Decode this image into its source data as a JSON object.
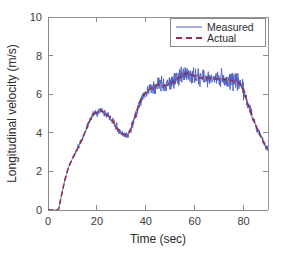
{
  "chart_data": {
    "type": "line",
    "title": "",
    "xlabel": "Time (sec)",
    "ylabel": "Longitudinal velocity (m/s)",
    "xlim": [
      0,
      90
    ],
    "ylim": [
      0,
      10
    ],
    "xticks": [
      0,
      20,
      40,
      60,
      80
    ],
    "yticks": [
      0,
      2,
      4,
      6,
      8,
      10
    ],
    "xticklabels": [
      "0",
      "20",
      "40",
      "60",
      "80"
    ],
    "yticklabels": [
      "0",
      "2",
      "4",
      "6",
      "8",
      "10"
    ],
    "grid": false,
    "legend_position": "upper right",
    "colors": {
      "measured": "#4f5fbf",
      "actual": "#93304a",
      "axis": "#8a8a8a",
      "text": "#2b2b2b",
      "background": "#ffffff"
    },
    "series": [
      {
        "name": "Measured",
        "style": "solid",
        "color": "#4f5fbf",
        "noise": true,
        "description": "Noisy measured longitudinal velocity signal"
      },
      {
        "name": "Actual",
        "style": "dashed",
        "color": "#93304a",
        "noise": false,
        "description": "Smooth ground-truth longitudinal velocity"
      }
    ],
    "x": [
      0,
      1,
      2,
      3,
      4,
      4.5,
      5,
      6,
      7,
      8,
      9,
      10,
      11,
      12,
      13,
      14,
      15,
      16,
      17,
      18,
      19,
      20,
      21,
      22,
      23,
      24,
      25,
      26,
      27,
      28,
      29,
      30,
      31,
      32,
      33,
      34,
      35,
      36,
      37,
      38,
      39,
      40,
      41,
      42,
      43,
      44,
      45,
      46,
      47,
      48,
      49,
      50,
      51,
      52,
      53,
      54,
      55,
      56,
      57,
      58,
      59,
      60,
      61,
      62,
      63,
      64,
      65,
      66,
      67,
      68,
      69,
      70,
      71,
      72,
      73,
      74,
      75,
      76,
      77,
      78,
      79,
      80,
      81,
      82,
      83,
      84,
      85,
      86,
      87,
      88,
      89,
      90
    ],
    "values": [
      0.0,
      0.0,
      0.0,
      0.0,
      0.0,
      0.1,
      0.45,
      1.05,
      1.6,
      2.05,
      2.4,
      2.65,
      2.9,
      3.15,
      3.4,
      3.7,
      4.0,
      4.3,
      4.6,
      4.85,
      5.0,
      5.05,
      5.1,
      5.15,
      5.05,
      4.95,
      4.85,
      4.7,
      4.5,
      4.3,
      4.1,
      3.98,
      3.92,
      3.9,
      3.98,
      4.25,
      4.6,
      5.0,
      5.4,
      5.7,
      5.95,
      6.1,
      6.2,
      6.3,
      6.35,
      6.45,
      6.5,
      6.5,
      6.45,
      6.45,
      6.5,
      6.55,
      6.6,
      6.7,
      6.8,
      6.9,
      7.0,
      7.05,
      7.1,
      7.05,
      7.0,
      6.95,
      6.9,
      6.85,
      6.85,
      6.85,
      6.85,
      6.8,
      6.8,
      6.8,
      6.8,
      6.8,
      6.8,
      6.75,
      6.75,
      6.75,
      6.7,
      6.7,
      6.65,
      6.6,
      6.5,
      6.2,
      5.8,
      5.4,
      5.05,
      4.7,
      4.4,
      4.1,
      3.8,
      3.55,
      3.3,
      3.2
    ]
  },
  "axes": {
    "ylabel": "Longitudinal velocity (m/s)",
    "xlabel": "Time (sec)"
  },
  "legend": {
    "entries": [
      {
        "label": "Measured"
      },
      {
        "label": "Actual"
      }
    ]
  },
  "ticks": {
    "x": [
      "0",
      "20",
      "40",
      "60",
      "80"
    ],
    "y": [
      "0",
      "2",
      "4",
      "6",
      "8",
      "10"
    ]
  }
}
